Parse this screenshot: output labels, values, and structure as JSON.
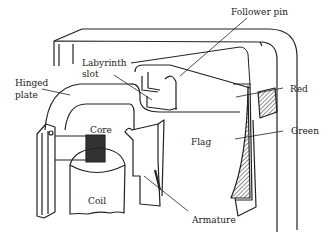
{
  "diagram": {
    "type": "mechanical-cutaway",
    "labels": {
      "follower_pin": "Follower pin",
      "labyrinth_slot_line1": "Labyrinth",
      "labyrinth_slot_line2": "slot",
      "hinged_plate_line1": "Hinged",
      "hinged_plate_line2": "plate",
      "red": "Red",
      "core": "Core",
      "green": "Green",
      "flag": "Flag",
      "coil": "Coil",
      "armature": "Armature"
    },
    "colors": {
      "ink": "#222222",
      "background": "#ffffff"
    }
  }
}
